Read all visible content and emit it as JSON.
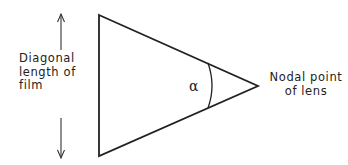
{
  "diagram": {
    "left_label": [
      "Diagonal",
      "length of",
      "film"
    ],
    "right_label": [
      "Nodal point",
      "of lens"
    ],
    "angle_symbol": "α",
    "colors": {
      "line": "#222222",
      "background": "#ffffff"
    }
  }
}
